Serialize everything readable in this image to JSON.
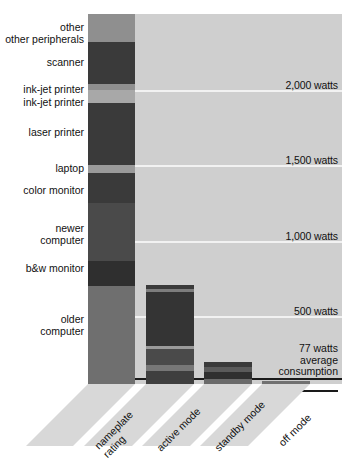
{
  "chart_data": {
    "type": "bar",
    "title": "",
    "subtitle": "",
    "xlabel": "",
    "ylabel": "watts",
    "ylim": [
      0,
      2470
    ],
    "grid": true,
    "legend_position": "none",
    "categories": [
      "nameplate rating",
      "active mode",
      "standby mode",
      "off mode"
    ],
    "gridlines": [
      {
        "value": 2000,
        "label": "2,000 watts"
      },
      {
        "value": 1500,
        "label": "1,500 watts"
      },
      {
        "value": 1000,
        "label": "1,000 watts"
      },
      {
        "value": 500,
        "label": "500 watts"
      }
    ],
    "annotations": [
      {
        "value": 77,
        "label_lines": [
          "77 watts",
          "average",
          "consumption"
        ]
      }
    ],
    "stack_labels": [
      "other peripherals",
      "scanner",
      "ink-jet printer",
      "ink-jet printer",
      "laser printer",
      "laptop",
      "color monitor",
      "newer computer",
      "b&w monitor",
      "older computer"
    ],
    "series": [
      {
        "name": "nameplate rating",
        "total": 2470,
        "segments": [
          {
            "label": "other peripherals",
            "value": 190,
            "color": "#8f8f8f"
          },
          {
            "label": "scanner",
            "value": 280,
            "color": "#3a3a3a"
          },
          {
            "label": "ink-jet printer",
            "value": 40,
            "color": "#8f8f8f"
          },
          {
            "label": "ink-jet printer",
            "value": 85,
            "color": "#a8a8a8"
          },
          {
            "label": "laser printer",
            "value": 410,
            "color": "#3a3a3a"
          },
          {
            "label": "laptop",
            "value": 55,
            "color": "#9a9a9a"
          },
          {
            "label": "color monitor",
            "value": 200,
            "color": "#3a3a3a"
          },
          {
            "label": "newer computer",
            "value": 390,
            "color": "#4a4a4a"
          },
          {
            "label": "b&w monitor",
            "value": 165,
            "color": "#2f2f2f"
          },
          {
            "label": "older computer",
            "value": 655,
            "color": "#6f6f6f"
          }
        ]
      },
      {
        "name": "active mode",
        "total": 660,
        "segments": [
          {
            "value": 25,
            "color": "#3a3a3a"
          },
          {
            "value": 20,
            "color": "#7d7d7d"
          },
          {
            "value": 360,
            "color": "#343434"
          },
          {
            "value": 25,
            "color": "#9a9a9a"
          },
          {
            "value": 105,
            "color": "#4a4a4a"
          },
          {
            "value": 35,
            "color": "#777777"
          },
          {
            "value": 90,
            "color": "#3f3f3f"
          }
        ]
      },
      {
        "name": "standby mode",
        "total": 145,
        "segments": [
          {
            "value": 30,
            "color": "#3a3a3a"
          },
          {
            "value": 35,
            "color": "#5a5a5a"
          },
          {
            "value": 45,
            "color": "#2f2f2f"
          },
          {
            "value": 35,
            "color": "#6a6a6a"
          }
        ]
      },
      {
        "name": "off mode",
        "total": 18,
        "segments": [
          {
            "value": 18,
            "color": "#707070"
          }
        ]
      }
    ]
  },
  "axis": {
    "tick_labels": [
      "nameplate rating",
      "active mode",
      "standby mode",
      "off mode"
    ]
  },
  "caption": {
    "text": ""
  }
}
